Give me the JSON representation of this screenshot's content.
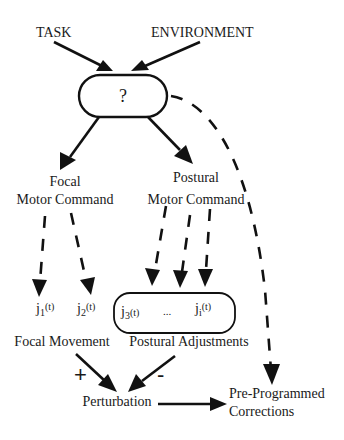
{
  "diagram": {
    "inputs": {
      "task": "TASK",
      "environment": "ENVIRONMENT"
    },
    "central_node": {
      "label": "?"
    },
    "commands": {
      "focal": {
        "line1": "Focal",
        "line2": "Motor Command"
      },
      "postural": {
        "line1": "Postural",
        "line2": "Motor Command"
      }
    },
    "joints": {
      "j1": {
        "base": "j",
        "sub": "1",
        "arg": "(t)"
      },
      "j2": {
        "base": "j",
        "sub": "2",
        "arg": "(t)"
      },
      "j3": {
        "base": "j",
        "sub": "3",
        "arg": "(t)"
      },
      "ellipsis": "...",
      "ji": {
        "base": "j",
        "sub": "i",
        "arg": "(t)"
      }
    },
    "outcomes": {
      "focal_movement": "Focal Movement",
      "postural_adjustments": "Postural Adjustments"
    },
    "signs": {
      "plus": "+",
      "minus": "-"
    },
    "perturbation": "Perturbation",
    "corrections": {
      "line1": "Pre-Programmed",
      "line2": "Corrections"
    }
  }
}
